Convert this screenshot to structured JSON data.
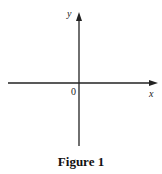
{
  "figure": {
    "caption": "Figure 1",
    "axes": {
      "x_label": "x",
      "y_label": "y",
      "origin_label": "0"
    },
    "colors": {
      "axis": "#222222",
      "background": "#ffffff"
    }
  }
}
